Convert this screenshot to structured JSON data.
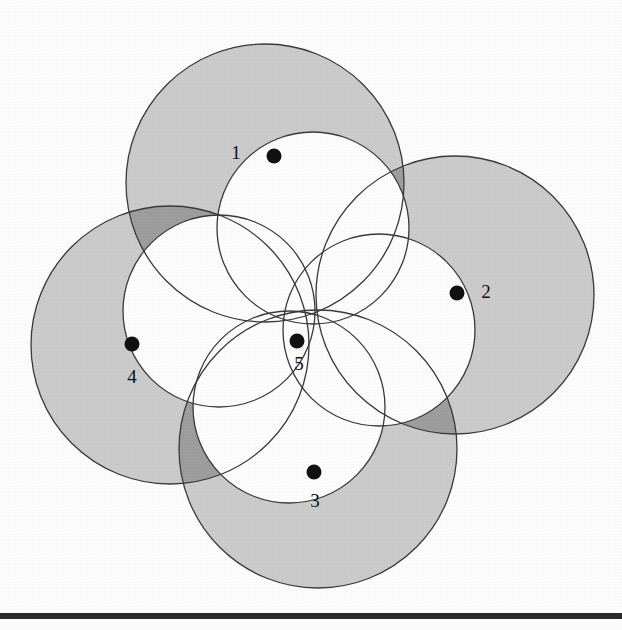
{
  "figure": {
    "kind": "four-circle-overlap-diagram",
    "background_color": "#ffffff",
    "canvas": {
      "width": 622,
      "height": 630
    },
    "stroke_color": "#3a3a3a",
    "stroke_width": 1.3,
    "fill_light_gray": "#cdcdcd",
    "fill_dark_gray": "#9f9f9f",
    "fill_white": "#ffffff",
    "marker_color": "#121212",
    "marker_radius": 7.5,
    "label_color": "#111111",
    "label_font_size": 19
  },
  "circles": [
    {
      "id": "circle-1",
      "label": "1",
      "cx": 265,
      "cy": 183,
      "r": 139
    },
    {
      "id": "circle-2",
      "label": "2",
      "cx": 455,
      "cy": 295,
      "r": 139
    },
    {
      "id": "circle-3",
      "label": "3",
      "cx": 318,
      "cy": 449,
      "r": 139
    },
    {
      "id": "circle-4",
      "label": "4",
      "cx": 170,
      "cy": 345,
      "r": 139
    }
  ],
  "inner_circles": [
    {
      "id": "inner-circle-a",
      "cx": 313,
      "cy": 228,
      "r": 96
    },
    {
      "id": "inner-circle-b",
      "cx": 379,
      "cy": 330,
      "r": 96
    },
    {
      "id": "inner-circle-c",
      "cx": 289,
      "cy": 407,
      "r": 96
    },
    {
      "id": "inner-circle-d",
      "cx": 219,
      "cy": 311,
      "r": 96
    }
  ],
  "markers": [
    {
      "id": "marker-1",
      "label": "1",
      "cx": 274,
      "cy": 156,
      "label_x": 236,
      "label_y": 155
    },
    {
      "id": "marker-2",
      "label": "2",
      "cx": 457,
      "cy": 293,
      "label_x": 486,
      "label_y": 294
    },
    {
      "id": "marker-3",
      "label": "3",
      "cx": 314,
      "cy": 472,
      "label_x": 315,
      "label_y": 503
    },
    {
      "id": "marker-4",
      "label": "4",
      "cx": 132,
      "cy": 344,
      "label_x": 132,
      "label_y": 379
    },
    {
      "id": "marker-5",
      "label": "5",
      "cx": 297,
      "cy": 341,
      "label_x": 299,
      "label_y": 366
    }
  ],
  "common_point": {
    "x": 313,
    "y": 323
  },
  "bottom_rule": {
    "y": 613,
    "height": 6,
    "color": "#2a2a2a"
  }
}
